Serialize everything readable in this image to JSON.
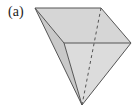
{
  "figure": {
    "label": "(a)",
    "shape": "inverted-pyramid",
    "colors": {
      "fill": "#d9d9d9",
      "edge": "#555555",
      "background": "#ffffff"
    }
  }
}
